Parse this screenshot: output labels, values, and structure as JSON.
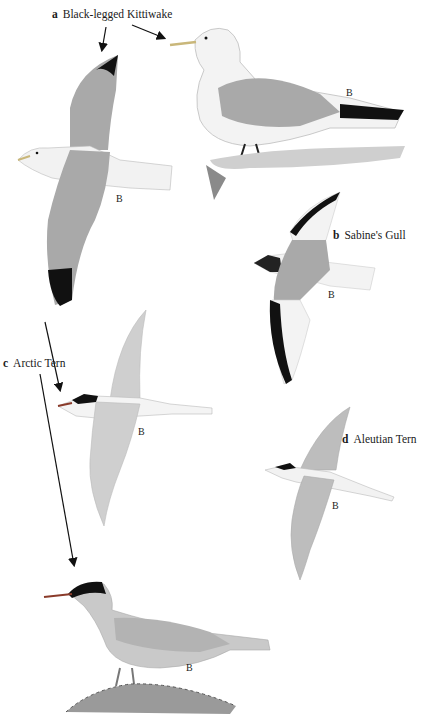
{
  "plate": {
    "species": [
      {
        "letter": "a",
        "name": "Black-legged Kittiwake"
      },
      {
        "letter": "b",
        "name": "Sabine's Gull"
      },
      {
        "letter": "c",
        "name": "Arctic Tern"
      },
      {
        "letter": "d",
        "name": "Aleutian Tern"
      }
    ],
    "figure_marks": {
      "kittiwake_flying": "B",
      "kittiwake_standing": "B",
      "sabines_gull": "B",
      "arctic_tern_flying": "B",
      "aleutian_tern": "B",
      "arctic_tern_standing": "B"
    },
    "colors": {
      "background": "#ffffff",
      "mantle_grey": "#a9a9a9",
      "light_grey": "#cfcfcf",
      "black": "#111111",
      "white_body": "#f4f4f4"
    }
  }
}
